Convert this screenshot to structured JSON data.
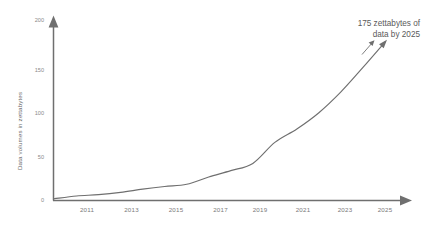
{
  "chart_data": {
    "type": "line",
    "title": "",
    "subtitle": "",
    "xlabel": "",
    "ylabel": "Data volumes in zettabytes",
    "x": [
      2010,
      2011,
      2012,
      2013,
      2014,
      2015,
      2016,
      2017,
      2018,
      2019,
      2020,
      2021,
      2022,
      2023,
      2024,
      2025
    ],
    "values": [
      2,
      5,
      6.5,
      9,
      12.5,
      15.5,
      18,
      26,
      33,
      41,
      64.2,
      79,
      97,
      120,
      147,
      175
    ],
    "series": [
      {
        "name": "Data volumes in zettabytes",
        "values": [
          2,
          5,
          6.5,
          9,
          12.5,
          15.5,
          18,
          26,
          33,
          41,
          64.2,
          79,
          97,
          120,
          147,
          175
        ]
      }
    ],
    "xlim": [
      2010,
      2025
    ],
    "ylim": [
      0,
      200
    ],
    "xticks": [
      "2011",
      "2013",
      "2015",
      "2017",
      "2019",
      "2021",
      "2023",
      "2025"
    ],
    "xtick_values": [
      2011,
      2013,
      2015,
      2017,
      2019,
      2021,
      2023,
      2025
    ],
    "yticks": [
      "0",
      "50",
      "100",
      "150",
      "200"
    ],
    "ytick_values": [
      0,
      50,
      100,
      150,
      200
    ],
    "grid": false,
    "legend": false,
    "legend_position": "none",
    "annotations": [
      {
        "name": "end-callout",
        "line1": "175 zettabytes of",
        "line2": "data by 2025",
        "points_to_year": 2025,
        "points_to_value": 175
      }
    ],
    "colors": {
      "line": "#6f6f6f",
      "axis": "#6f6f6f",
      "tick_label": "#8a8a8a",
      "axis_label": "#6b6b6b",
      "annotation": "#5a5a5a",
      "background": "#ffffff"
    }
  }
}
